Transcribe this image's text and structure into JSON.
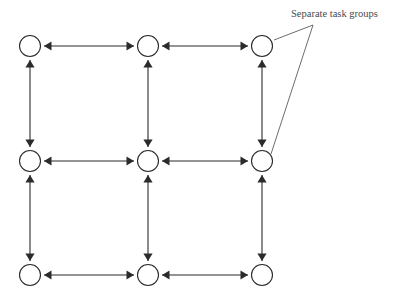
{
  "figure": {
    "type": "grid-graph-diagram",
    "background_color": "#ffffff",
    "stroke_color": "#2b2b2b",
    "annotation_color": "#4a4a4a",
    "leader_color": "#6d6d6d"
  },
  "annotations": [
    {
      "id": "separate-task-groups",
      "label": "Separate task groups",
      "text_x": 291,
      "text_y": 17,
      "vertex": {
        "x": 313,
        "y": 25
      },
      "leaders": [
        {
          "to_x": 274,
          "to_y": 40
        },
        {
          "to_x": 271,
          "to_y": 154
        }
      ]
    }
  ],
  "graph": {
    "node_radius": 10.5,
    "rows": 3,
    "cols": 3,
    "columns_x": [
      30,
      148,
      262
    ],
    "rows_y": [
      46,
      161,
      275
    ],
    "nodes": [
      {
        "id": "n-r0-c0",
        "row": 0,
        "col": 0,
        "x": 30,
        "y": 46
      },
      {
        "id": "n-r0-c1",
        "row": 0,
        "col": 1,
        "x": 148,
        "y": 46
      },
      {
        "id": "n-r0-c2",
        "row": 0,
        "col": 2,
        "x": 262,
        "y": 46
      },
      {
        "id": "n-r1-c0",
        "row": 1,
        "col": 0,
        "x": 30,
        "y": 161
      },
      {
        "id": "n-r1-c1",
        "row": 1,
        "col": 1,
        "x": 148,
        "y": 161
      },
      {
        "id": "n-r1-c2",
        "row": 1,
        "col": 2,
        "x": 262,
        "y": 161
      },
      {
        "id": "n-r2-c0",
        "row": 2,
        "col": 0,
        "x": 30,
        "y": 275
      },
      {
        "id": "n-r2-c1",
        "row": 2,
        "col": 1,
        "x": 148,
        "y": 275
      },
      {
        "id": "n-r2-c2",
        "row": 2,
        "col": 2,
        "x": 262,
        "y": 275
      }
    ],
    "edges": [
      {
        "id": "e-h-r0-c0-c1",
        "orientation": "horizontal",
        "bidirectional": true,
        "from": "n-r0-c0",
        "to": "n-r0-c1"
      },
      {
        "id": "e-h-r0-c1-c2",
        "orientation": "horizontal",
        "bidirectional": true,
        "from": "n-r0-c1",
        "to": "n-r0-c2"
      },
      {
        "id": "e-h-r1-c0-c1",
        "orientation": "horizontal",
        "bidirectional": true,
        "from": "n-r1-c0",
        "to": "n-r1-c1"
      },
      {
        "id": "e-h-r1-c1-c2",
        "orientation": "horizontal",
        "bidirectional": true,
        "from": "n-r1-c1",
        "to": "n-r1-c2"
      },
      {
        "id": "e-h-r2-c0-c1",
        "orientation": "horizontal",
        "bidirectional": true,
        "from": "n-r2-c0",
        "to": "n-r2-c1"
      },
      {
        "id": "e-h-r2-c1-c2",
        "orientation": "horizontal",
        "bidirectional": true,
        "from": "n-r2-c1",
        "to": "n-r2-c2"
      },
      {
        "id": "e-v-c0-r0-r1",
        "orientation": "vertical",
        "bidirectional": true,
        "from": "n-r0-c0",
        "to": "n-r1-c0"
      },
      {
        "id": "e-v-c0-r1-r2",
        "orientation": "vertical",
        "bidirectional": true,
        "from": "n-r1-c0",
        "to": "n-r2-c0"
      },
      {
        "id": "e-v-c1-r0-r1",
        "orientation": "vertical",
        "bidirectional": true,
        "from": "n-r0-c1",
        "to": "n-r1-c1"
      },
      {
        "id": "e-v-c1-r1-r2",
        "orientation": "vertical",
        "bidirectional": true,
        "from": "n-r1-c1",
        "to": "n-r2-c1"
      },
      {
        "id": "e-v-c2-r0-r1",
        "orientation": "vertical",
        "bidirectional": true,
        "from": "n-r0-c2",
        "to": "n-r1-c2"
      },
      {
        "id": "e-v-c2-r1-r2",
        "orientation": "vertical",
        "bidirectional": true,
        "from": "n-r1-c2",
        "to": "n-r2-c2"
      }
    ]
  }
}
